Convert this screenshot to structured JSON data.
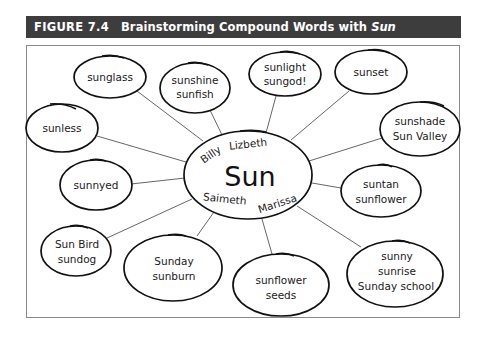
{
  "figure": {
    "label": "FIGURE 7.4",
    "title": "Brainstorming Compound Words with",
    "title_italic": "Sun",
    "header_bg": "#3d3d3d",
    "header_fg": "#ffffff"
  },
  "center": {
    "word": "Sun",
    "names": [
      "Billy",
      "Lizbeth",
      "Saimeth",
      "Marissa"
    ]
  },
  "nodes": [
    {
      "id": "sunglass",
      "lines": [
        "sunglass"
      ]
    },
    {
      "id": "sunshine",
      "lines": [
        "sunshine",
        "sunfish"
      ]
    },
    {
      "id": "sunlight",
      "lines": [
        "sunlight",
        "sungod!"
      ]
    },
    {
      "id": "sunset",
      "lines": [
        "sunset"
      ]
    },
    {
      "id": "sunless",
      "lines": [
        "sunless"
      ]
    },
    {
      "id": "sunshade",
      "lines": [
        "sunshade",
        "Sun Valley"
      ]
    },
    {
      "id": "sunnyed",
      "lines": [
        "sunnyed"
      ]
    },
    {
      "id": "suntan",
      "lines": [
        "suntan",
        "sunflower"
      ]
    },
    {
      "id": "sunbird",
      "lines": [
        "Sun Bird",
        "sundog"
      ]
    },
    {
      "id": "sunday",
      "lines": [
        "Sunday",
        "sunburn"
      ]
    },
    {
      "id": "sunflower",
      "lines": [
        "sunflower",
        "seeds"
      ]
    },
    {
      "id": "sunny",
      "lines": [
        "sunny",
        "sunrise",
        "Sunday school"
      ]
    }
  ]
}
